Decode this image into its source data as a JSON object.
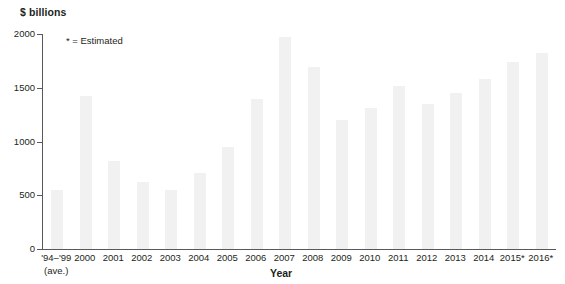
{
  "chart_data": {
    "type": "bar",
    "title": "",
    "subtitle": "",
    "ylabel": "$ billions",
    "xlabel": "Year",
    "ylim": [
      0,
      2000
    ],
    "yticks": [
      0,
      500,
      1000,
      1500,
      2000
    ],
    "ytick_labels": [
      "0",
      "500",
      "1000",
      "1500",
      "2000"
    ],
    "grid": false,
    "legend_position": "none",
    "annotations": [
      "* = Estimated"
    ],
    "bar_color": "#f1f1f1",
    "axis_color": "#58595b",
    "categories": [
      "'94–'99",
      "2000",
      "2001",
      "2002",
      "2003",
      "2004",
      "2005",
      "2006",
      "2007",
      "2008",
      "2009",
      "2010",
      "2011",
      "2012",
      "2013",
      "2014",
      "2015*",
      "2016*"
    ],
    "category_sublabels": [
      "(ave.)",
      "",
      "",
      "",
      "",
      "",
      "",
      "",
      "",
      "",
      "",
      "",
      "",
      "",
      "",
      "",
      "",
      ""
    ],
    "values": [
      550,
      1420,
      820,
      620,
      545,
      710,
      950,
      1400,
      1970,
      1690,
      1200,
      1310,
      1520,
      1350,
      1450,
      1580,
      1740,
      1820
    ]
  }
}
